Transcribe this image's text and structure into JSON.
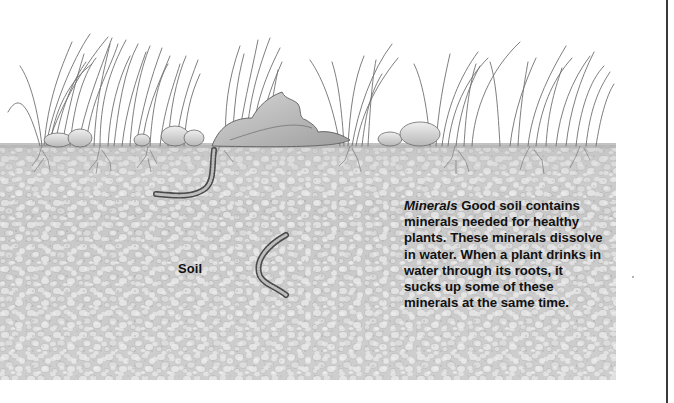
{
  "illustration": {
    "subject": "Cross-section of soil with grass, stones, a leaf and earthworms",
    "labels": {
      "soil": "Soil"
    },
    "caption": {
      "term": "Minerals",
      "text": " Good soil contains minerals needed for healthy plants. These minerals dissolve in water. When a plant drinks in water through its roots, it sucks up some of these minerals at the same time."
    },
    "colors": {
      "soil_base": "#c9c9c9",
      "soil_pebble": "#dedede",
      "soil_shadow": "#a9a9a9",
      "grass_stroke": "#6f6f6f",
      "text": "#111111",
      "page_edge": "#3a3a3a",
      "background": "#ffffff"
    }
  }
}
